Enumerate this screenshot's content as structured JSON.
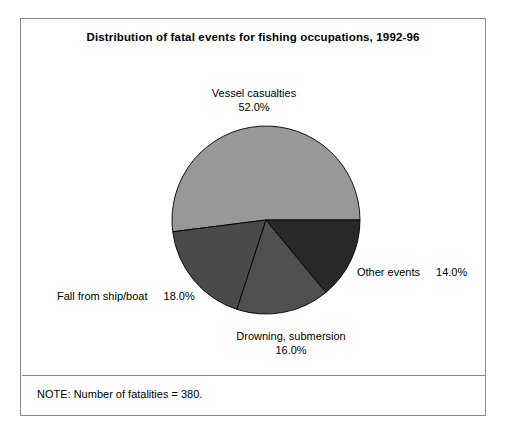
{
  "figure": {
    "title": "Distribution of fatal events for fishing occupations, 1992-96",
    "note": "NOTE: Number of fatalities = 380.",
    "border_color": "#8c8c8c",
    "background": "#ffffff"
  },
  "chart_data": {
    "type": "pie",
    "title": "Distribution of fatal events for fishing occupations, 1992-96",
    "xlabel": "",
    "ylabel": "",
    "total_label": "NOTE: Number of fatalities = 380.",
    "total": 380,
    "units": "percent",
    "start_angle_deg": 0,
    "direction": "counterclockwise",
    "legend": "none",
    "grid": false,
    "categories": [
      "Vessel casualties",
      "Fall from ship/boat",
      "Drowning, submersion",
      "Other events"
    ],
    "values": [
      52.0,
      18.0,
      16.0,
      14.0
    ],
    "value_labels": [
      "52.0%",
      "18.0%",
      "16.0%",
      "14.0%"
    ],
    "colors": [
      "#989898",
      "#4a4a4a",
      "#505050",
      "#282828"
    ],
    "slices": [
      {
        "name": "Vessel casualties",
        "value": 52.0,
        "value_label": "52.0%",
        "color": "#989898",
        "label_position": "top"
      },
      {
        "name": "Fall from ship/boat",
        "value": 18.0,
        "value_label": "18.0%",
        "color": "#4a4a4a",
        "label_position": "left"
      },
      {
        "name": "Drowning, submersion",
        "value": 16.0,
        "value_label": "16.0%",
        "color": "#505050",
        "label_position": "bottom"
      },
      {
        "name": "Other events",
        "value": 14.0,
        "value_label": "14.0%",
        "color": "#282828",
        "label_position": "right"
      }
    ],
    "geometry": {
      "center_x": 245,
      "center_y": 201,
      "radius": 94,
      "edge_color": "#000000"
    }
  }
}
